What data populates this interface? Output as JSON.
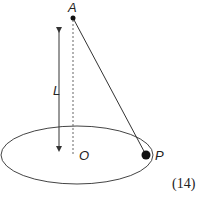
{
  "diagram": {
    "type": "conical-pendulum",
    "points": {
      "A": {
        "label": "A",
        "x": 73,
        "y": 18
      },
      "O": {
        "label": "O",
        "x": 73,
        "y": 155
      },
      "P": {
        "label": "P",
        "x": 146,
        "y": 155
      }
    },
    "length_label": "L",
    "equation_number": "(14)",
    "colors": {
      "stroke": "#333333",
      "text": "#222222",
      "background": "#ffffff"
    }
  }
}
